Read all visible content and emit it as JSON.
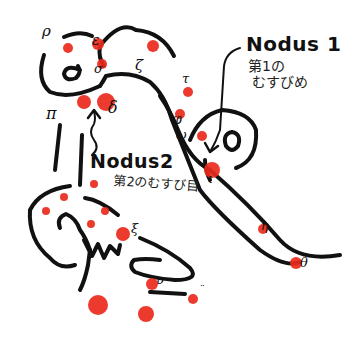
{
  "diagram": {
    "colors": {
      "line": "#111111",
      "dot": "#ea2a1c",
      "background": "#ffffff"
    },
    "nodes": [
      {
        "id": "nodus1",
        "title": "Nodus 1",
        "subtitle": "第1の\n むすびめ"
      },
      {
        "id": "nodus2",
        "title": "Nodus2",
        "subtitle": "第2のむすび目"
      }
    ],
    "greek_labels": {
      "rho": "ρ",
      "epsilon": "ε",
      "zeta": "ζ",
      "sigma": "σ",
      "delta": "δ",
      "pi": "π",
      "tau": "τ",
      "phi": "φ",
      "omega": "ω",
      "iota": "ι",
      "xi": "ξ",
      "upsilon": "υ",
      "eta": "η",
      "theta": "θ",
      "mu": "¨"
    }
  }
}
